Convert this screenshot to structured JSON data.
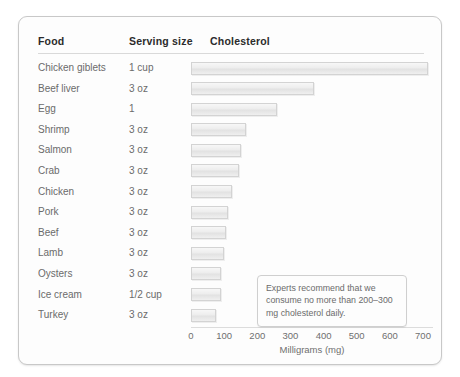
{
  "card": {
    "headers": {
      "food": "Food",
      "serving": "Serving size",
      "cholesterol": "Cholesterol"
    },
    "annotation": "Experts recommend that we consume no more than 200–300 mg cholesterol daily."
  },
  "chart_data": {
    "type": "bar",
    "orientation": "horizontal",
    "title": "Cholesterol",
    "xlabel": "Milligrams (mg)",
    "ylabel": "Food",
    "xlim": [
      0,
      700
    ],
    "xticks": [
      0,
      100,
      200,
      300,
      400,
      500,
      600,
      700
    ],
    "xticklabels": [
      "0",
      "100",
      "200",
      "300",
      "400",
      "500",
      "600",
      "700"
    ],
    "grid": false,
    "legend": false,
    "categories": [
      "Chicken giblets",
      "Beef liver",
      "Egg",
      "Shrimp",
      "Salmon",
      "Crab",
      "Chicken",
      "Pork",
      "Beef",
      "Lamb",
      "Oysters",
      "Ice cream",
      "Turkey"
    ],
    "serving_sizes": [
      "1 cup",
      "3 oz",
      "1",
      "3 oz",
      "3 oz",
      "3 oz",
      "3 oz",
      "3 oz",
      "3 oz",
      "3 oz",
      "3 oz",
      "1/2 cup",
      "3 oz"
    ],
    "values": [
      715,
      370,
      260,
      165,
      150,
      145,
      125,
      110,
      105,
      100,
      90,
      90,
      75
    ],
    "annotations": [
      "Experts recommend that we consume no more than 200–300 mg cholesterol daily."
    ]
  }
}
